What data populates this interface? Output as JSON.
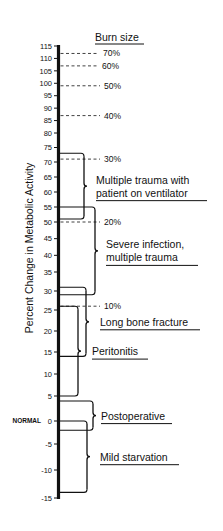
{
  "chart_data": {
    "type": "range-scale",
    "title": "",
    "ylabel": "Percent Change in Metabolic Activity",
    "ylim": [
      -15,
      115
    ],
    "grid": false,
    "y_ticks": [
      115,
      110,
      105,
      100,
      95,
      90,
      85,
      80,
      75,
      70,
      65,
      60,
      55,
      50,
      45,
      40,
      35,
      30,
      25,
      20,
      15,
      10,
      5,
      0,
      -5,
      -10,
      -15
    ],
    "y_tick_labels": [
      "115",
      "110",
      "105",
      "100",
      "95",
      "90",
      "85",
      "80",
      "75",
      "70",
      "65",
      "60",
      "55",
      "50",
      "45",
      "40",
      "35",
      "30",
      "25",
      "20",
      "15",
      "10",
      "5",
      "0",
      "-5",
      "-10",
      "-15"
    ],
    "zero_label": "NORMAL",
    "burn_size": {
      "title": "Burn size",
      "markers": [
        {
          "label": "70%",
          "value": 112
        },
        {
          "label": "60%",
          "value": 107
        },
        {
          "label": "50%",
          "value": 99
        },
        {
          "label": "40%",
          "value": 87
        },
        {
          "label": "30%",
          "value": 71
        },
        {
          "label": "20%",
          "value": 50
        },
        {
          "label": "10%",
          "value": 26
        }
      ]
    },
    "ranges": [
      {
        "label_lines": [
          "Multiple trauma with",
          "patient on ventilator"
        ],
        "low": 51,
        "high": 73
      },
      {
        "label_lines": [
          "Severe infection,",
          "multiple trauma"
        ],
        "low": 29,
        "high": 55
      },
      {
        "label_lines": [
          "Long bone fracture"
        ],
        "low": 14,
        "high": 31
      },
      {
        "label_lines": [
          "Peritonitis"
        ],
        "low": 5,
        "high": 26
      },
      {
        "label_lines": [
          "Postoperative"
        ],
        "low": -2,
        "high": 4
      },
      {
        "label_lines": [
          "Mild starvation"
        ],
        "low": -14,
        "high": 0
      }
    ]
  },
  "colors": {
    "ink": "#111111",
    "background": "#ffffff"
  }
}
